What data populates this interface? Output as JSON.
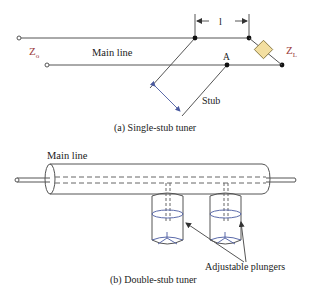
{
  "figure_a": {
    "z0_label": "Z",
    "z0_sub": "o",
    "zl_label": "Z",
    "zl_sub": "L",
    "main_line_label": "Main line",
    "length_label": "l",
    "point_label": "A",
    "stub_label": "Stub",
    "caption": "(a) Single-stub tuner",
    "load_color": "#f3dfa0"
  },
  "figure_b": {
    "main_line_label": "Main line",
    "plungers_label": "Adjustable plungers",
    "caption": "(b) Double-stub tuner"
  }
}
